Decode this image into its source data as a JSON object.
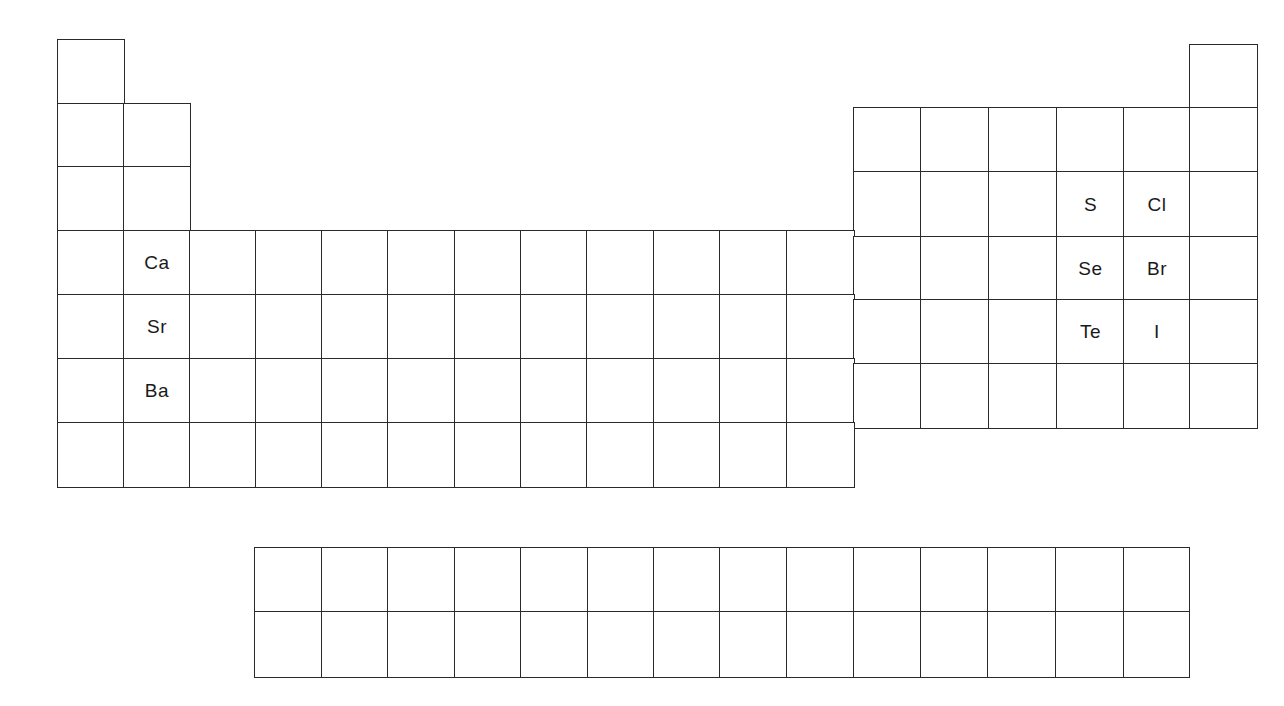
{
  "colors": {
    "line": "#2a2a2a",
    "text": "#1a1a1a",
    "background": "#ffffff"
  },
  "layout": {
    "col_x": [
      58,
      124,
      190,
      256,
      322,
      388,
      455,
      521,
      587,
      654,
      720,
      787,
      854,
      921,
      989,
      1057,
      1124,
      1190,
      1257
    ],
    "row_y_left": [
      40,
      104,
      167,
      231,
      295,
      359,
      423,
      487
    ],
    "row_y_right": [
      45,
      108,
      172,
      237,
      300,
      364,
      428
    ],
    "fblock_col_x": [
      255,
      322,
      388,
      455,
      521,
      588,
      654,
      720,
      787,
      854,
      921,
      988,
      1056,
      1124,
      1189
    ],
    "fblock_row_y": [
      548,
      612,
      677
    ]
  },
  "main_table": {
    "periods": [
      {
        "period": 1,
        "groups": [
          1,
          18
        ]
      },
      {
        "period": 2,
        "groups": [
          1,
          2,
          13,
          14,
          15,
          16,
          17,
          18
        ]
      },
      {
        "period": 3,
        "groups": [
          1,
          2,
          13,
          14,
          15,
          16,
          17,
          18
        ]
      },
      {
        "period": 4,
        "groups": [
          1,
          2,
          3,
          4,
          5,
          6,
          7,
          8,
          9,
          10,
          11,
          12,
          13,
          14,
          15,
          16,
          17,
          18
        ]
      },
      {
        "period": 5,
        "groups": [
          1,
          2,
          3,
          4,
          5,
          6,
          7,
          8,
          9,
          10,
          11,
          12,
          13,
          14,
          15,
          16,
          17,
          18
        ]
      },
      {
        "period": 6,
        "groups": [
          1,
          2,
          3,
          4,
          5,
          6,
          7,
          8,
          9,
          10,
          11,
          12,
          13,
          14,
          15,
          16,
          17,
          18
        ]
      },
      {
        "period": 7,
        "groups": [
          1,
          2,
          3,
          4,
          5,
          6,
          7,
          8,
          9,
          10,
          11,
          12
        ]
      }
    ],
    "labeled_elements": [
      {
        "symbol": "Ca",
        "period": 4,
        "group": 2
      },
      {
        "symbol": "Sr",
        "period": 5,
        "group": 2
      },
      {
        "symbol": "Ba",
        "period": 6,
        "group": 2
      },
      {
        "symbol": "S",
        "period": 3,
        "group": 16
      },
      {
        "symbol": "Cl",
        "period": 3,
        "group": 17
      },
      {
        "symbol": "Se",
        "period": 4,
        "group": 16
      },
      {
        "symbol": "Br",
        "period": 4,
        "group": 17
      },
      {
        "symbol": "Te",
        "period": 5,
        "group": 16
      },
      {
        "symbol": "I",
        "period": 5,
        "group": 17
      }
    ]
  },
  "f_block": {
    "rows": 2,
    "columns": 14
  }
}
